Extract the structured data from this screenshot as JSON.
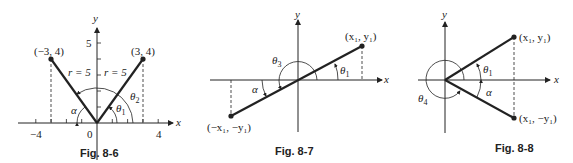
{
  "figures": [
    {
      "caption": "Fig. 8-6",
      "axis_x": "x",
      "axis_y": "y",
      "tick_labels": {
        "x_neg": "−4",
        "origin": "0",
        "x_pos": "4",
        "y": "5"
      },
      "points": [
        {
          "label": "(−3, 4)"
        },
        {
          "label": "(3, 4)"
        }
      ],
      "r_left": "r = 5",
      "r_right": "r = 5",
      "angles": {
        "alpha": "α",
        "theta1": "θ",
        "theta1_sub": "1",
        "theta2": "θ",
        "theta2_sub": "2"
      }
    },
    {
      "caption": "Fig. 8-7",
      "axis_x": "x",
      "axis_y": "y",
      "points": [
        {
          "label": "(x₁, y₁)"
        },
        {
          "label": "(−x₁, −y₁)"
        }
      ],
      "angles": {
        "alpha": "α",
        "theta1": "θ",
        "theta1_sub": "1",
        "theta3": "θ",
        "theta3_sub": "3"
      }
    },
    {
      "caption": "Fig. 8-8",
      "axis_x": "x",
      "axis_y": "y",
      "points": [
        {
          "label": "(x₁, y₁)"
        },
        {
          "label": "(x₁, −y₁)"
        }
      ],
      "angles": {
        "alpha": "α",
        "theta1": "θ",
        "theta1_sub": "1",
        "theta4": "θ",
        "theta4_sub": "4"
      }
    }
  ]
}
